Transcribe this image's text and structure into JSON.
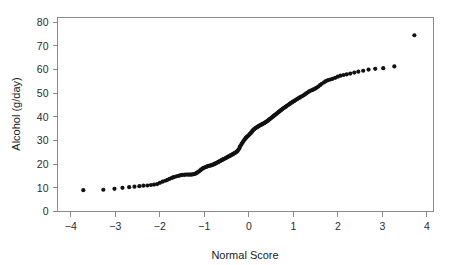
{
  "figure": {
    "background_color": "#ffffff",
    "frame_color": "#8a8a8a",
    "point_color": "#111111"
  },
  "chart_data": {
    "type": "scatter",
    "title": "",
    "subtitle": "",
    "xlabel": "Normal Score",
    "ylabel": "Alcohol (g/day)",
    "xlim": [
      -4.3,
      4.15
    ],
    "ylim": [
      0,
      82
    ],
    "xticks": [
      -4,
      -3,
      -2,
      -1,
      0,
      1,
      2,
      3,
      4
    ],
    "xtick_labels": [
      "−4",
      "−3",
      "−2",
      "−1",
      "0",
      "1",
      "2",
      "3",
      "4"
    ],
    "yticks": [
      0,
      10,
      20,
      30,
      40,
      50,
      60,
      70,
      80
    ],
    "ytick_labels": [
      "0",
      "10",
      "20",
      "30",
      "40",
      "50",
      "60",
      "70",
      "80"
    ],
    "grid": false,
    "legend": null,
    "annotations": [],
    "marker": "circle",
    "marker_size": 2.1,
    "series": [
      {
        "name": "Alcohol consumption quantiles",
        "x": [
          -3.72,
          -3.27,
          -3.02,
          -2.84,
          -2.69,
          -2.57,
          -2.46,
          -2.37,
          -2.28,
          -2.2,
          -2.13,
          -2.06,
          -2.0,
          -1.94,
          -1.88,
          -1.83,
          -1.78,
          -1.73,
          -1.69,
          -1.64,
          -1.6,
          -1.56,
          -1.52,
          -1.49,
          -1.45,
          -1.42,
          -1.38,
          -1.35,
          -1.32,
          -1.29,
          -1.26,
          -1.23,
          -1.2,
          -1.17,
          -1.15,
          -1.12,
          -1.09,
          -1.07,
          -1.04,
          -1.02,
          -0.99,
          -0.97,
          -0.94,
          -0.92,
          -0.9,
          -0.87,
          -0.85,
          -0.83,
          -0.81,
          -0.78,
          -0.76,
          -0.74,
          -0.72,
          -0.7,
          -0.68,
          -0.66,
          -0.64,
          -0.62,
          -0.6,
          -0.58,
          -0.56,
          -0.54,
          -0.52,
          -0.5,
          -0.48,
          -0.46,
          -0.44,
          -0.42,
          -0.4,
          -0.38,
          -0.36,
          -0.35,
          -0.33,
          -0.31,
          -0.29,
          -0.27,
          -0.25,
          -0.23,
          -0.21,
          -0.2,
          -0.18,
          -0.16,
          -0.14,
          -0.12,
          -0.1,
          -0.08,
          -0.07,
          -0.05,
          -0.03,
          -0.01,
          0.01,
          0.03,
          0.05,
          0.07,
          0.08,
          0.1,
          0.12,
          0.14,
          0.16,
          0.18,
          0.2,
          0.21,
          0.23,
          0.25,
          0.27,
          0.29,
          0.31,
          0.33,
          0.35,
          0.36,
          0.38,
          0.4,
          0.42,
          0.44,
          0.46,
          0.48,
          0.5,
          0.52,
          0.54,
          0.56,
          0.58,
          0.6,
          0.62,
          0.64,
          0.66,
          0.68,
          0.7,
          0.72,
          0.74,
          0.76,
          0.78,
          0.81,
          0.83,
          0.85,
          0.87,
          0.9,
          0.92,
          0.94,
          0.97,
          0.99,
          1.02,
          1.04,
          1.07,
          1.09,
          1.12,
          1.15,
          1.17,
          1.2,
          1.23,
          1.26,
          1.29,
          1.32,
          1.35,
          1.38,
          1.42,
          1.45,
          1.49,
          1.52,
          1.56,
          1.6,
          1.64,
          1.69,
          1.73,
          1.78,
          1.83,
          1.88,
          1.94,
          2.0,
          2.06,
          2.13,
          2.2,
          2.28,
          2.37,
          2.46,
          2.57,
          2.69,
          2.84,
          3.02,
          3.27,
          3.72
        ],
        "y": [
          9.0,
          9.2,
          9.6,
          10.0,
          10.3,
          10.5,
          10.7,
          10.9,
          11.0,
          11.2,
          11.4,
          11.6,
          12.1,
          12.6,
          13.0,
          13.4,
          13.8,
          14.2,
          14.5,
          14.8,
          15.0,
          15.2,
          15.4,
          15.5,
          15.5,
          15.6,
          15.6,
          15.6,
          15.6,
          15.6,
          15.7,
          15.8,
          16.0,
          16.3,
          16.6,
          17.0,
          17.4,
          17.8,
          18.1,
          18.4,
          18.6,
          18.8,
          19.0,
          19.2,
          19.3,
          19.4,
          19.5,
          19.6,
          19.8,
          20.0,
          20.2,
          20.4,
          20.6,
          20.8,
          21.0,
          21.2,
          21.4,
          21.6,
          21.8,
          22.0,
          22.2,
          22.4,
          22.6,
          22.8,
          23.0,
          23.2,
          23.4,
          23.6,
          23.8,
          24.0,
          24.2,
          24.4,
          24.6,
          24.8,
          25.0,
          25.3,
          25.7,
          26.2,
          26.8,
          27.4,
          28.0,
          28.6,
          29.2,
          29.8,
          30.3,
          30.7,
          31.1,
          31.4,
          31.8,
          32.1,
          32.5,
          32.9,
          33.3,
          33.7,
          34.1,
          34.5,
          34.8,
          35.1,
          35.4,
          35.6,
          35.8,
          36.0,
          36.2,
          36.4,
          36.6,
          36.8,
          37.0,
          37.2,
          37.4,
          37.6,
          37.8,
          38.0,
          38.3,
          38.6,
          38.9,
          39.2,
          39.5,
          39.8,
          40.1,
          40.4,
          40.7,
          41.0,
          41.3,
          41.6,
          41.9,
          42.2,
          42.5,
          42.8,
          43.1,
          43.4,
          43.7,
          44.0,
          44.3,
          44.6,
          44.9,
          45.2,
          45.5,
          45.8,
          46.1,
          46.4,
          46.7,
          47.0,
          47.3,
          47.6,
          47.9,
          48.2,
          48.5,
          48.8,
          49.1,
          49.5,
          49.9,
          50.3,
          50.7,
          51.0,
          51.3,
          51.6,
          51.9,
          52.3,
          52.8,
          53.4,
          54.0,
          54.6,
          55.1,
          55.5,
          55.8,
          56.1,
          56.5,
          57.0,
          57.4,
          57.7,
          58.0,
          58.3,
          58.7,
          59.1,
          59.5,
          60.0,
          60.3,
          60.6,
          61.3,
          74.5
        ]
      }
    ]
  }
}
